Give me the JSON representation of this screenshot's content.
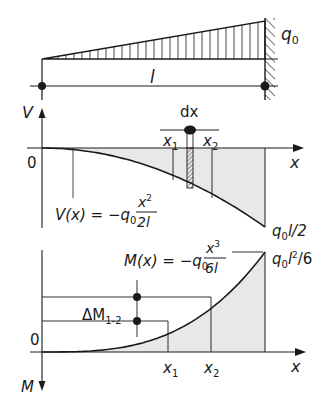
{
  "colors": {
    "line": "#1a1a1a",
    "fill": "#e8e8e8",
    "hatch": "#1a1a1a",
    "background": "#ffffff"
  },
  "beam": {
    "load_label": "q",
    "load_sub": "0",
    "length_label": "l"
  },
  "shear": {
    "axis_label": "V",
    "x_label": "x",
    "origin_label": "0",
    "dx_label": "dx",
    "x1_label": "x",
    "x1_sub": "1",
    "x2_label": "x",
    "x2_sub": "2",
    "formula_lhs": "V(x) = −q",
    "formula_sub": "0",
    "formula_num": "x",
    "formula_num_exp": "2",
    "formula_den": "2l",
    "end_value_q": "q",
    "end_value_sub": "0",
    "end_value_rest": "l/2"
  },
  "moment": {
    "axis_label": "M",
    "x_label": "x",
    "origin_label": "0",
    "x1_label": "x",
    "x1_sub": "1",
    "x2_label": "x",
    "x2_sub": "2",
    "delta_label": "ΔM",
    "delta_sub": "1-2",
    "formula_lhs": "M(x) = −q",
    "formula_sub": "0",
    "formula_num": "x",
    "formula_num_exp": "3",
    "formula_den": "6l",
    "end_value_q": "q",
    "end_value_sub": "0",
    "end_value_l": "l",
    "end_value_exp": "2",
    "end_value_rest": "/6"
  }
}
